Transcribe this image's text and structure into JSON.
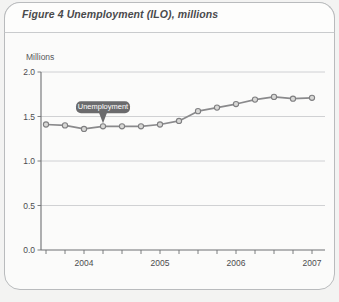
{
  "figure": {
    "label": "Figure 4",
    "title": "Figure 4  Unemployment (ILO), millions"
  },
  "chart_data": {
    "type": "line",
    "title": "Unemployment (ILO), millions",
    "xlabel": "",
    "ylabel": "Millions",
    "ylim": [
      0.0,
      2.0
    ],
    "yticks": [
      "0.0",
      "0.5",
      "1.0",
      "1.5",
      "2.0"
    ],
    "ytick_values": [
      0.0,
      0.5,
      1.0,
      1.5,
      2.0
    ],
    "xtick_labels": [
      "2004",
      "2005",
      "2006",
      "2007"
    ],
    "grid": true,
    "legend": "none",
    "annotations": [
      {
        "text": "Unemployment",
        "points_to_index": 3
      }
    ],
    "series": [
      {
        "name": "Unemployment",
        "x": [
          "2003 Q4",
          "2004 Q1",
          "2004 Q2",
          "2004 Q3",
          "2004 Q4",
          "2005 Q1",
          "2005 Q2",
          "2005 Q3",
          "2005 Q4",
          "2006 Q1",
          "2006 Q2",
          "2006 Q3",
          "2006 Q4",
          "2007 Q1",
          "2007 Q2"
        ],
        "values": [
          1.41,
          1.4,
          1.36,
          1.39,
          1.39,
          1.39,
          1.41,
          1.45,
          1.56,
          1.6,
          1.64,
          1.69,
          1.72,
          1.7,
          1.71
        ]
      }
    ]
  },
  "colors": {
    "line": "#8a8a8c",
    "marker_fill": "#d8d8d6",
    "marker_stroke": "#7f7f81",
    "grid": "#c5c7c9",
    "axis": "#6e7072",
    "callout_bg": "#6b6b6d",
    "callout_text": "#ffffff",
    "frame": "#b9bbbd",
    "page_bg": "#f3f3f2"
  }
}
